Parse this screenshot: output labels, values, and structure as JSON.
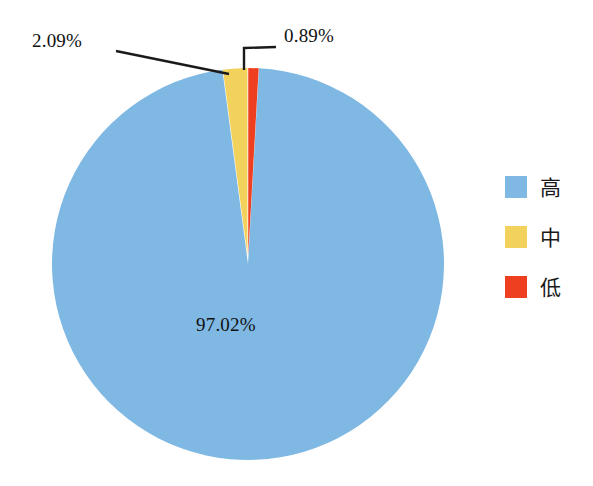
{
  "chart_data": {
    "type": "pie",
    "title": "",
    "categories": [
      "高",
      "中",
      "低"
    ],
    "values": [
      97.02,
      2.09,
      0.89
    ],
    "data_labels": [
      "97.02%",
      "2.09%",
      "0.89%"
    ],
    "units": "percent",
    "colors": [
      "#7FB8E3",
      "#F2D25C",
      "#EE4020"
    ],
    "exploded": [
      false,
      true,
      true
    ],
    "legend_position": "right",
    "grid": false,
    "xlabel": "",
    "ylabel": "",
    "start_angle_deg": -90,
    "direction": "clockwise"
  },
  "labels": {
    "high_pct": "97.02%",
    "mid_pct": "2.09%",
    "low_pct": "0.89%"
  },
  "legend": {
    "items": [
      {
        "label": "高",
        "color": "#7FB8E3",
        "value": "97.02%"
      },
      {
        "label": "中",
        "color": "#F2D25C",
        "value": "2.09%"
      },
      {
        "label": "低",
        "color": "#EE4020",
        "value": "0.89%"
      }
    ]
  },
  "colors": {
    "high": "#7FB8E3",
    "mid": "#F2D25C",
    "low": "#EE4020",
    "leader_line": "#1a1a1a",
    "background": "#ffffff"
  }
}
